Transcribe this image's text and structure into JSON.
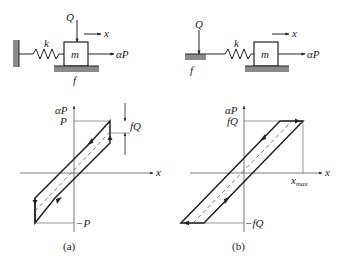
{
  "panel_a": {
    "caption": "(a)",
    "mechanism": {
      "spring_label": "k",
      "mass_label": "m",
      "normal_force_label": "Q",
      "displacement_label": "x",
      "applied_force_label": "αP",
      "friction_label": "f"
    },
    "plot": {
      "y_axis_label": "αP",
      "x_axis_label": "x",
      "top_label": "P",
      "bottom_label": "−P",
      "gap_label": "fQ"
    }
  },
  "panel_b": {
    "caption": "(b)",
    "mechanism": {
      "spring_label": "k",
      "mass_label": "m",
      "normal_force_label": "Q",
      "displacement_label": "x",
      "applied_force_label": "αP",
      "friction_label": "f"
    },
    "plot": {
      "y_axis_label": "αP",
      "x_axis_label": "x",
      "top_label": "fQ",
      "bottom_label": "−fQ",
      "xmax_label": "x",
      "xmax_sub": "max"
    }
  },
  "colors": {
    "line": "#222222",
    "ground": "#8a8a8a",
    "dashed": "#555555"
  }
}
